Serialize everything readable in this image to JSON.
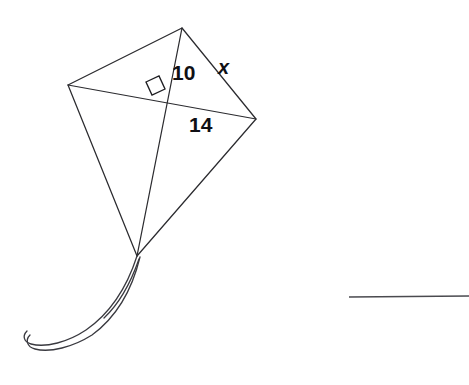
{
  "page": {
    "background_color": "#ffffff",
    "width": 469,
    "height": 385
  },
  "figure": {
    "name": "kite-with-diagonals",
    "shape": "kite",
    "stroke_color": "#2b2b2f",
    "label_color": "#101014",
    "vertices": {
      "top": {
        "x": 182,
        "y": 28
      },
      "left": {
        "x": 68,
        "y": 85
      },
      "right": {
        "x": 256,
        "y": 119
      },
      "bottom": {
        "x": 137,
        "y": 256
      }
    },
    "diagonal_intersection": {
      "x": 163,
      "y": 98
    },
    "right_angle_marker": {
      "name": "right-angle-square",
      "points": "146,82 159,76 165,89 152,95",
      "present": true
    },
    "labels": [
      {
        "id": "seg-10",
        "text": "10",
        "x": 172,
        "y": 80,
        "style": "bold"
      },
      {
        "id": "seg-x",
        "text": "x",
        "x": 218,
        "y": 74,
        "style": "bold-italic"
      },
      {
        "id": "seg-14",
        "text": "14",
        "x": 189,
        "y": 132,
        "style": "bold"
      }
    ]
  },
  "tail": {
    "name": "kite-tail",
    "color": "#3a3a40",
    "strand_outer": "M137,256 C128,284 112,312 86,330 C68,342 46,348 31,344 C24,342 22,336 27,331",
    "strand_inner": "M140,257 C133,286 118,316 92,335 C73,347 50,353 35,349 C27,347 25,340 30,335",
    "strand_short": "M139,259 C131,282 121,302 104,318"
  },
  "answer_line": {
    "name": "answer-blank-line",
    "x1": 349,
    "y1": 297,
    "x2": 469,
    "y2": 296,
    "color": "#4a4a4f"
  }
}
